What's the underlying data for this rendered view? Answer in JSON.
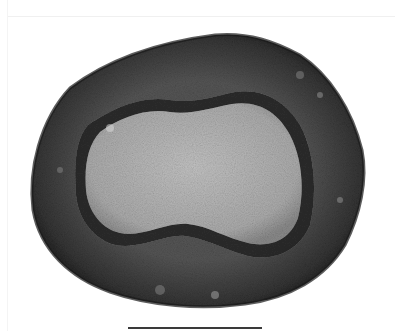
{
  "image": {
    "subject": "cross-section specimen",
    "colors": {
      "background": "#ffffff",
      "outer_ring": "#4a4a4a",
      "outer_ring_dark": "#222222",
      "inner_core": "#b4b4b4",
      "scale_bar": "#3a3a3a"
    }
  },
  "scale_bar": {
    "label": ""
  }
}
